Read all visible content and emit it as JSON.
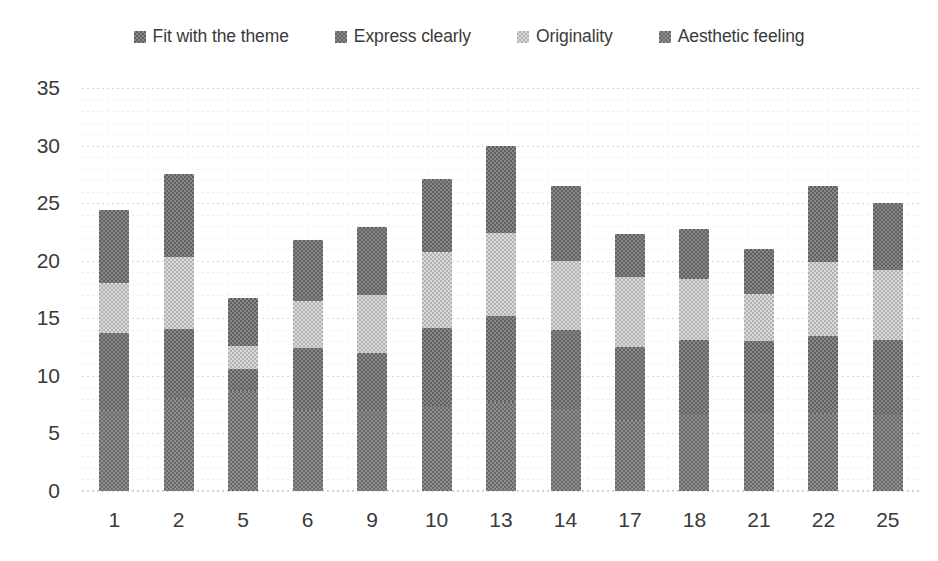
{
  "chart_data": {
    "type": "bar",
    "subtype": "stacked-bar",
    "title": "",
    "xlabel": "",
    "ylabel": "",
    "ylim": [
      0,
      35
    ],
    "ytick_step": 5,
    "yticks": [
      "35",
      "30",
      "25",
      "20",
      "15",
      "10",
      "5",
      "0"
    ],
    "grid": true,
    "grid_axis": "y",
    "legend_position": "top-center",
    "categories": [
      "1",
      "2",
      "5",
      "6",
      "9",
      "10",
      "13",
      "14",
      "17",
      "18",
      "21",
      "22",
      "25"
    ],
    "series": [
      {
        "name": "Aesthetic feeling",
        "color": "#767676",
        "values": [
          7.0,
          8.1,
          8.7,
          7.0,
          7.0,
          7.3,
          7.7,
          7.1,
          6.2,
          6.6,
          6.8,
          6.8,
          6.6
        ]
      },
      {
        "name": "Originality",
        "color": "#6f6f6f",
        "values": [
          6.7,
          6.0,
          1.9,
          5.4,
          5.0,
          6.9,
          7.5,
          6.9,
          6.3,
          6.5,
          6.2,
          6.7,
          6.5
        ]
      },
      {
        "name": "Express clearly",
        "color": "#c0c0c0",
        "values": [
          4.4,
          6.2,
          2.0,
          4.1,
          5.0,
          6.6,
          7.2,
          6.0,
          6.1,
          5.3,
          4.1,
          6.4,
          6.1
        ]
      },
      {
        "name": "Fit with the theme",
        "color": "#6e6e6e",
        "values": [
          6.3,
          7.2,
          4.2,
          5.3,
          5.9,
          6.3,
          7.6,
          6.5,
          3.7,
          4.4,
          3.9,
          6.6,
          5.8
        ]
      }
    ],
    "totals": [
      24.4,
      27.5,
      16.8,
      21.8,
      22.9,
      27.1,
      30.0,
      26.5,
      22.3,
      22.8,
      21.0,
      26.5,
      25.0
    ]
  },
  "legend": {
    "items": [
      {
        "label": "Fit with the theme",
        "color": "#6e6e6e",
        "marker": "square-pattern-marker"
      },
      {
        "label": "Express clearly",
        "color": "#6f6f6f",
        "marker": "square-pattern-marker"
      },
      {
        "label": "Originality",
        "color": "#c0c0c0",
        "marker": "square-pattern-marker"
      },
      {
        "label": "Aesthetic feeling",
        "color": "#767676",
        "marker": "square-pattern-marker"
      }
    ]
  },
  "colors": {
    "dark": "#6e6e6e",
    "medium": "#7a7a7a",
    "light": "#c2c2c2",
    "gridline": "#d8d8d8",
    "text": "#3a3a3a",
    "background": "#ffffff"
  }
}
